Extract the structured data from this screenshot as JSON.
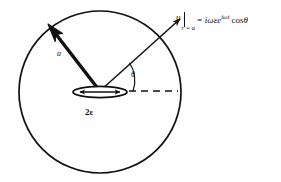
{
  "figure": {
    "type": "physics-diagram",
    "stroke_color": "#111111",
    "background_color": "#ffffff"
  },
  "circle": {
    "name": "outer-spherical-boundary",
    "center_x": 100,
    "center_y": 92,
    "radius": 81,
    "stroke_width": 1.6
  },
  "disc": {
    "name": "oscillating-disc",
    "center_x": 100,
    "center_y": 92,
    "half_width": 27,
    "half_height": 5.5,
    "label": "2ε",
    "oscillation_arrow": "double-headed-horizontal"
  },
  "radius_vector": {
    "label": "a",
    "from_x": 100,
    "from_y": 90,
    "to_x": 50,
    "to_y": 26,
    "style": "thick-solid-arrow"
  },
  "velocity_vector": {
    "label": "u",
    "from_x": 100,
    "from_y": 90,
    "to_x": 182,
    "to_y": 17,
    "style": "thin-open-arrow"
  },
  "reference_axis": {
    "name": "horizontal-dashed-axis",
    "from_x": 128,
    "from_y": 91,
    "to_x": 178,
    "to_y": 91,
    "style": "dashed"
  },
  "angle": {
    "symbol": "θ",
    "between": "velocity-vector and horizontal-axis",
    "arc_radius": 33
  },
  "equation": {
    "lhs_symbol": "u",
    "evaluated_at": "r = a",
    "rhs_prefix": "= iωεe",
    "rhs_exponent": "iωt",
    "rhs_suffix": "cos",
    "rhs_angle": "θ",
    "full_text": "u|r = a = iωεe^{iωt} cosθ"
  }
}
